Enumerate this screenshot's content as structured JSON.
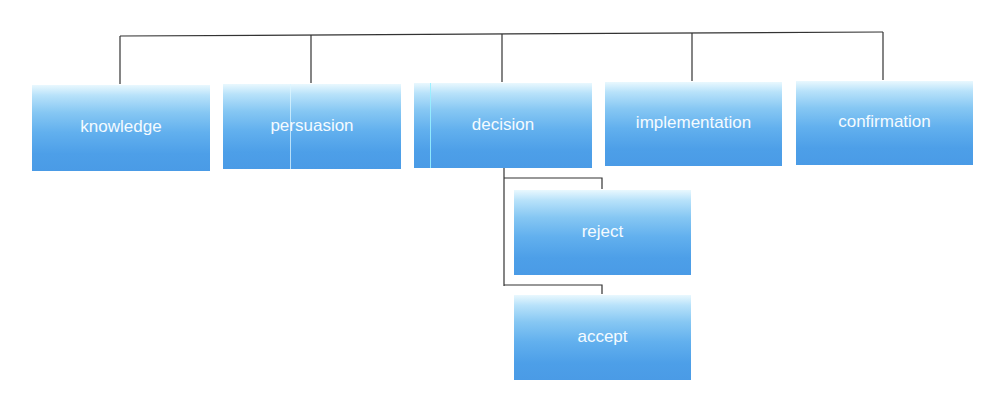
{
  "diagram": {
    "type": "hierarchy",
    "colors": {
      "box_top": "#e9f8fe",
      "box_bottom": "#4a9be6",
      "text": "#f4fbff",
      "line": "#333333",
      "background": "#ffffff"
    },
    "top_level": [
      {
        "id": "knowledge",
        "label": "knowledge"
      },
      {
        "id": "persuasion",
        "label": "persuasion"
      },
      {
        "id": "decision",
        "label": "decision"
      },
      {
        "id": "implementation",
        "label": "implementation"
      },
      {
        "id": "confirmation",
        "label": "confirmation"
      }
    ],
    "decision_children": [
      {
        "id": "reject",
        "label": "reject"
      },
      {
        "id": "accept",
        "label": "accept"
      }
    ]
  }
}
